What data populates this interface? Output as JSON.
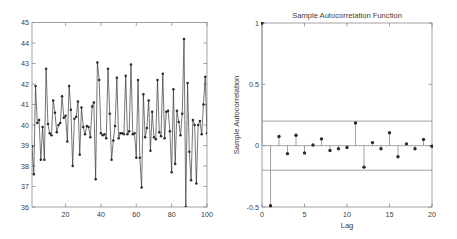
{
  "figure": {
    "background_color": "#ffffff",
    "axis_color": "#8c8c8c",
    "data_color": "#2b2b2b",
    "text_color": "#3b3b3b",
    "panels": [
      "timeseries-plot",
      "autocorrelation-plot"
    ]
  },
  "chart_data": [
    {
      "type": "line",
      "name": "timeseries-plot",
      "title": "",
      "xlabel": "",
      "ylabel": "",
      "xlim": [
        1,
        100
      ],
      "ylim": [
        36,
        45
      ],
      "xticks": [
        20,
        40,
        60,
        80,
        100
      ],
      "yticks": [
        36,
        37,
        38,
        39,
        40,
        41,
        42,
        43,
        44,
        45
      ],
      "xticklabels": [
        "20",
        "40",
        "60",
        "80",
        "100"
      ],
      "yticklabels": [
        "36",
        "37",
        "38",
        "39",
        "40",
        "41",
        "42",
        "43",
        "44",
        "45"
      ],
      "grid": false,
      "legend": null,
      "marker": "filled-circle",
      "x": [
        1,
        2,
        3,
        4,
        5,
        6,
        7,
        8,
        9,
        10,
        11,
        12,
        13,
        14,
        15,
        16,
        17,
        18,
        19,
        20,
        21,
        22,
        23,
        24,
        25,
        26,
        27,
        28,
        29,
        30,
        31,
        32,
        33,
        34,
        35,
        36,
        37,
        38,
        39,
        40,
        41,
        42,
        43,
        44,
        45,
        46,
        47,
        48,
        49,
        50,
        51,
        52,
        53,
        54,
        55,
        56,
        57,
        58,
        59,
        60,
        61,
        62,
        63,
        64,
        65,
        66,
        67,
        68,
        69,
        70,
        71,
        72,
        73,
        74,
        75,
        76,
        77,
        78,
        79,
        80,
        81,
        82,
        83,
        84,
        85,
        86,
        87,
        88,
        89,
        90,
        91,
        92,
        93,
        94,
        95,
        96,
        97,
        98,
        99,
        100
      ],
      "values": [
        38.95,
        37.6,
        41.9,
        40.1,
        40.25,
        38.3,
        39.9,
        38.3,
        42.75,
        40.05,
        39.6,
        39.5,
        41.2,
        40.6,
        39.65,
        40.0,
        40.1,
        41.4,
        40.35,
        40.45,
        39.2,
        41.9,
        40.75,
        38.0,
        40.3,
        40.4,
        41.15,
        38.55,
        40.85,
        39.9,
        39.55,
        39.95,
        39.9,
        39.4,
        40.9,
        41.1,
        37.35,
        43.05,
        42.2,
        39.6,
        39.5,
        39.55,
        39.35,
        42.75,
        40.55,
        38.3,
        39.25,
        39.95,
        42.3,
        39.35,
        39.6,
        39.6,
        39.55,
        42.4,
        39.55,
        39.7,
        42.95,
        39.55,
        39.6,
        38.4,
        42.2,
        38.4,
        36.95,
        41.5,
        39.4,
        39.85,
        41.2,
        38.75,
        40.65,
        39.4,
        39.3,
        42.2,
        39.65,
        39.45,
        42.5,
        39.35,
        40.65,
        40.7,
        39.7,
        37.7,
        41.75,
        38.1,
        40.7,
        40.15,
        39.5,
        40.55,
        44.2,
        36.0,
        42.05,
        38.7,
        37.3,
        40.25,
        40.0,
        37.15,
        40.0,
        40.2,
        39.55,
        41.0,
        42.35,
        39.6
      ]
    },
    {
      "type": "bar",
      "name": "autocorrelation-plot",
      "subtype": "stem",
      "title": "Sample Autocorrelation Function",
      "xlabel": "Lag",
      "ylabel": "Sample Autocorrelation",
      "xlim": [
        0,
        20
      ],
      "ylim": [
        -0.5,
        1
      ],
      "xticks": [
        0,
        5,
        10,
        15,
        20
      ],
      "yticks": [
        -0.5,
        0,
        0.5,
        1
      ],
      "xticklabels": [
        "0",
        "5",
        "10",
        "15",
        "20"
      ],
      "yticklabels": [
        "-0.5",
        "0",
        "0.5",
        "1"
      ],
      "grid": false,
      "legend": null,
      "marker": "filled-circle",
      "baseline": 0,
      "confidence_bounds": [
        0.2,
        -0.2
      ],
      "categories": [
        0,
        1,
        2,
        3,
        4,
        5,
        6,
        7,
        8,
        9,
        10,
        11,
        12,
        13,
        14,
        15,
        16,
        17,
        18,
        19,
        20
      ],
      "values": [
        1.0,
        -0.49,
        0.075,
        -0.065,
        0.085,
        -0.06,
        0.005,
        0.055,
        -0.04,
        -0.025,
        -0.015,
        0.185,
        -0.175,
        0.025,
        -0.025,
        0.105,
        -0.09,
        0.015,
        -0.025,
        0.05,
        -0.005
      ]
    }
  ]
}
